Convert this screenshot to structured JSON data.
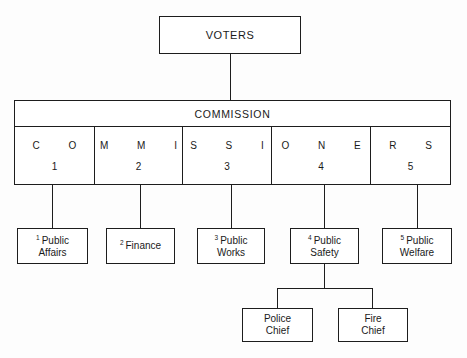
{
  "chart": {
    "type": "org-chart",
    "top_node": {
      "label": "VOTERS"
    },
    "commission": {
      "title": "COMMISSION",
      "cells": [
        {
          "letters": "C O",
          "number": "1"
        },
        {
          "letters": "M M I",
          "number": "2"
        },
        {
          "letters": "S S I",
          "number": "3"
        },
        {
          "letters": "O N E",
          "number": "4"
        },
        {
          "letters": "R S",
          "number": "5"
        }
      ]
    },
    "departments": [
      {
        "superscript": "1",
        "line1": "Public",
        "line2": "Affairs"
      },
      {
        "superscript": "2",
        "line1": "Finance",
        "line2": ""
      },
      {
        "superscript": "3",
        "line1": "Public",
        "line2": "Works"
      },
      {
        "superscript": "4",
        "line1": "Public",
        "line2": "Safety"
      },
      {
        "superscript": "5",
        "line1": "Public",
        "line2": "Welfare"
      }
    ],
    "subordinates": [
      {
        "line1": "Police",
        "line2": "Chief"
      },
      {
        "line1": "Fire",
        "line2": "Chief"
      }
    ],
    "caption": ""
  },
  "colors": {
    "line": "#1d1d1d",
    "box_fill": "#ffffff",
    "background": "#fdfdfd"
  }
}
